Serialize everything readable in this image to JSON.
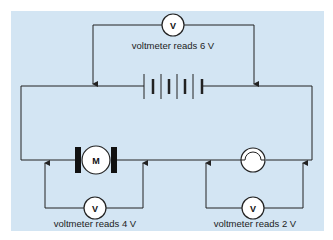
{
  "diagram": {
    "background_color": "#d3e5f3",
    "wire_color": "#222222",
    "components": {
      "battery": {
        "name": "battery",
        "cells": 4
      },
      "motor": {
        "name": "motor",
        "symbol": "M"
      },
      "lamp": {
        "name": "lamp"
      }
    },
    "voltmeters": [
      {
        "id": "top",
        "symbol": "V",
        "label": "voltmeter reads 6 V",
        "across": "battery"
      },
      {
        "id": "left",
        "symbol": "V",
        "label": "voltmeter reads 4 V",
        "across": "motor"
      },
      {
        "id": "right",
        "symbol": "V",
        "label": "voltmeter reads 2 V",
        "across": "lamp"
      }
    ]
  }
}
